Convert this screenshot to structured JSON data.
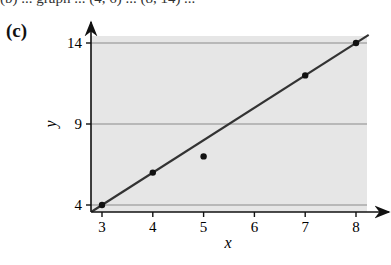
{
  "header": {
    "cut_text": "(b) ... graph ... (4, 6) ... (8, 14) ...",
    "panel_label": "(c)"
  },
  "chart_data": {
    "type": "scatter",
    "title": "",
    "panel": "(c)",
    "xlabel": "x",
    "ylabel": "y",
    "xlim": [
      2.8,
      8.7
    ],
    "ylim": [
      3.6,
      15.3
    ],
    "xticks": [
      3,
      4,
      5,
      6,
      7,
      8
    ],
    "yticks": [
      4,
      9,
      14
    ],
    "grid": "horizontal lines at y ticks",
    "background": "#e6e6e6",
    "points": [
      {
        "x": 3,
        "y": 4
      },
      {
        "x": 4,
        "y": 6
      },
      {
        "x": 5,
        "y": 7
      },
      {
        "x": 7,
        "y": 12
      },
      {
        "x": 8,
        "y": 14
      }
    ],
    "line": {
      "slope": 2,
      "intercept": -2,
      "x_from": 2.8,
      "x_to": 8.25,
      "label": "y = 2x - 2"
    }
  },
  "labels": {
    "x": "x",
    "y": "y",
    "xticks": [
      "3",
      "4",
      "5",
      "6",
      "7",
      "8"
    ],
    "yticks": [
      "4",
      "9",
      "14"
    ]
  }
}
